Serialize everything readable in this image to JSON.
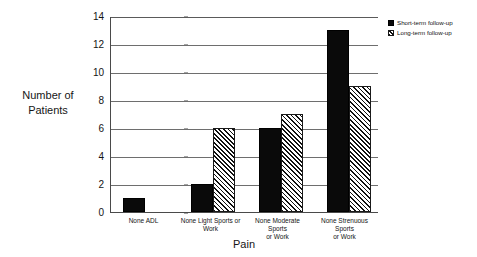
{
  "chart_data": {
    "type": "bar",
    "title": "",
    "subtitle": "",
    "xlabel": "Pain",
    "ylabel": "Number of Patients",
    "ylim": [
      0,
      14
    ],
    "yticks": [
      0,
      2,
      4,
      6,
      8,
      10,
      12,
      14
    ],
    "grid": true,
    "grid_axis": "y",
    "legend_position": "top-right-outside",
    "categories": [
      "None ADL",
      "None Light Sports or Work",
      "None Moderate Sports or Work",
      "None Strenuous Sports or Work"
    ],
    "series": [
      {
        "name": "Short-term follow-up",
        "fill": "solid-black",
        "color": "#0a0a0a",
        "values": [
          1,
          2,
          6,
          13
        ]
      },
      {
        "name": "Long-term follow-up",
        "fill": "diagonal-hatch",
        "color": "#111111",
        "values": [
          0,
          6,
          7,
          9
        ]
      }
    ]
  },
  "axes": {
    "y_title_line1": "Number of",
    "y_title_line2": "Patients",
    "x_title": "Pain",
    "y_tick_labels": [
      "14",
      "12",
      "10",
      "8",
      "6",
      "4",
      "2",
      "0"
    ]
  },
  "legend": {
    "items": [
      {
        "label": "Short-term follow-up"
      },
      {
        "label": "Long-term follow-up"
      }
    ]
  },
  "x_category_labels": [
    {
      "line1": "None ADL",
      "line2": ""
    },
    {
      "line1": "None Light Sports or",
      "line2": "Work"
    },
    {
      "line1": "None Moderate Sports",
      "line2": "or Work"
    },
    {
      "line1": "None Strenuous Sports",
      "line2": "or Work"
    }
  ]
}
